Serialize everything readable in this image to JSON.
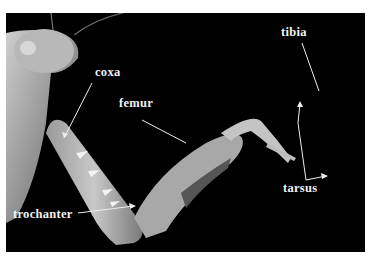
{
  "figure": {
    "labels": {
      "coxa": "coxa",
      "femur": "femur",
      "tibia": "tibia",
      "tarsus": "tarsus",
      "trochanter": "trochanter"
    },
    "colors": {
      "background": "#000000",
      "label": "#f2f2f2",
      "frame": "#ffffff"
    }
  }
}
